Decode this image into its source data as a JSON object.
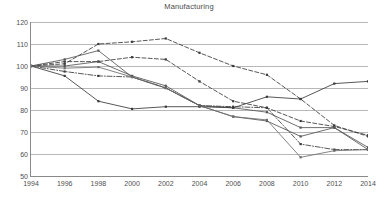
{
  "chart_data": {
    "type": "line",
    "title": "Manufacturing",
    "xlabel": "",
    "ylabel": "",
    "x": [
      1994,
      1996,
      1998,
      2000,
      2002,
      2004,
      2006,
      2008,
      2010,
      2012,
      2014
    ],
    "xtick_labels": [
      "1994",
      "1996",
      "1998",
      "2000",
      "2002",
      "2004",
      "2006",
      "2008",
      "2010",
      "2012",
      "2014"
    ],
    "ytick_labels": [
      "50",
      "60",
      "70",
      "80",
      "90",
      "100",
      "110",
      "120"
    ],
    "yticks": [
      50,
      60,
      70,
      80,
      90,
      100,
      110,
      120
    ],
    "xlim": [
      1994,
      2014
    ],
    "ylim": [
      50,
      120
    ],
    "grid": "horizontal",
    "legend": "none",
    "markers": "square",
    "series": [
      {
        "name": "series-1",
        "style": "dashed",
        "color": "#3a3a3a",
        "values": [
          100,
          101,
          110,
          111,
          112.5,
          106,
          100,
          96,
          85,
          73,
          68
        ]
      },
      {
        "name": "series-2",
        "style": "dashed",
        "color": "#3a3a3a",
        "values": [
          100,
          102,
          102,
          104,
          103,
          93,
          84,
          81,
          75,
          72.5,
          68.5
        ]
      },
      {
        "name": "series-3",
        "style": "solid",
        "color": "#555555",
        "values": [
          100,
          103,
          107,
          95,
          90,
          82,
          77,
          75,
          68,
          72,
          63
        ]
      },
      {
        "name": "series-4",
        "style": "solid",
        "color": "#555555",
        "values": [
          100,
          100,
          102,
          95.5,
          91,
          82,
          81,
          79,
          72,
          72,
          62
        ]
      },
      {
        "name": "series-5",
        "style": "dashdot",
        "color": "#3a3a3a",
        "values": [
          100,
          97.5,
          95.5,
          95,
          90,
          82,
          81.5,
          81,
          64.5,
          62,
          62
        ]
      },
      {
        "name": "series-6",
        "style": "solid",
        "color": "#3a3a3a",
        "values": [
          100,
          95.5,
          84,
          80.5,
          81.5,
          81.5,
          81,
          86,
          85,
          92,
          93
        ]
      },
      {
        "name": "series-7",
        "style": "solid",
        "color": "#6d6d6d",
        "values": [
          100,
          99,
          99.5,
          95,
          90,
          82,
          77,
          75.5,
          58.5,
          61.5,
          62
        ]
      }
    ]
  }
}
